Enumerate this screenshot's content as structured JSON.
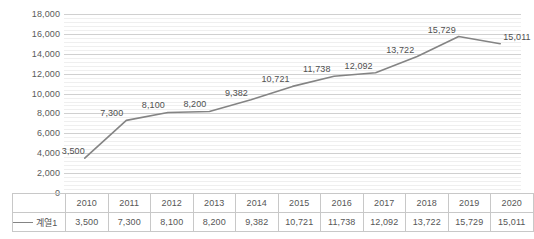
{
  "chart_data": {
    "type": "line",
    "title": "",
    "subtitle": "",
    "xlabel": "",
    "ylabel": "",
    "categories": [
      "2010",
      "2011",
      "2012",
      "2013",
      "2014",
      "2015",
      "2016",
      "2017",
      "2018",
      "2019",
      "2020"
    ],
    "series": [
      {
        "name": "계열1",
        "values": [
          3500,
          7300,
          8100,
          8200,
          9382,
          10721,
          11738,
          12092,
          13722,
          15729,
          15011
        ],
        "labels": [
          "3,500",
          "7,300",
          "8,100",
          "8,200",
          "9,382",
          "10,721",
          "11,738",
          "12,092",
          "13,722",
          "15,729",
          "15,011"
        ],
        "color": "#848484"
      }
    ],
    "ylim": [
      0,
      18000
    ],
    "ytick_step": 2000,
    "ytick_labels": [
      "18,000",
      "16,000",
      "14,000",
      "12,000",
      "10,000",
      "8,000",
      "6,000",
      "4,000",
      "2,000",
      "0"
    ],
    "ytick_values": [
      18000,
      16000,
      14000,
      12000,
      10000,
      8000,
      6000,
      4000,
      2000,
      0
    ],
    "minor_gridlines": true,
    "grid": true,
    "legend_position": "data-table-left",
    "show_data_labels": true,
    "show_data_table": true,
    "markers": false
  },
  "data_table": {
    "legend_label": "계열1",
    "legend_marker": "line-swatch-icon",
    "header_row": [
      "2010",
      "2011",
      "2012",
      "2013",
      "2014",
      "2015",
      "2016",
      "2017",
      "2018",
      "2019",
      "2020"
    ],
    "value_row": [
      "3,500",
      "7,300",
      "8,100",
      "8,200",
      "9,382",
      "10,721",
      "11,738",
      "12,092",
      "13,722",
      "15,729",
      "15,011"
    ]
  },
  "colors": {
    "series_line": "#848484",
    "major_gridline": "#d0d0d0",
    "minor_gridline": "#efefef",
    "table_border": "#c8c8c8",
    "text": "#565656",
    "background": "#ffffff"
  }
}
